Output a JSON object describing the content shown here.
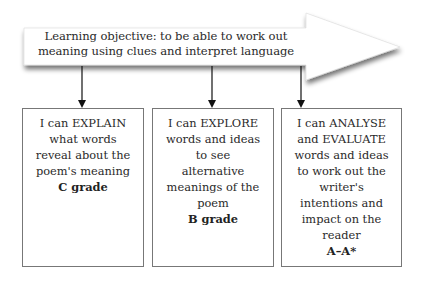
{
  "objective": {
    "line1": "Learning objective: to be able to work out",
    "line2": "meaning using clues and interpret language"
  },
  "boxes": [
    {
      "lines": [
        "I can EXPLAIN",
        "what words",
        "reveal about the",
        "poem's meaning"
      ],
      "grade": "C grade"
    },
    {
      "lines": [
        "I can EXPLORE",
        "words and ideas",
        "to see",
        "alternative",
        "meanings of the",
        "poem"
      ],
      "grade": "B grade"
    },
    {
      "lines": [
        "I can ANALYSE",
        "and EVALUATE",
        "words and ideas",
        "to work out the",
        "writer's",
        "intentions and",
        "impact on the",
        "reader"
      ],
      "grade": "A–A*"
    }
  ]
}
